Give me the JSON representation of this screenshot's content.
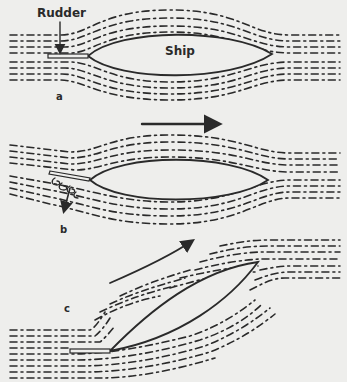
{
  "figure": {
    "labels": {
      "rudder": "Rudder",
      "ship": "Ship",
      "panel_a": "a",
      "panel_b": "b",
      "panel_c": "c"
    },
    "colors": {
      "background": "#eeeeec",
      "ink": "#2a2a2a"
    },
    "panels": [
      {
        "id": "a",
        "description": "Ship moving straight, rudder centered, streamlines symmetric around hull"
      },
      {
        "id": "b",
        "description": "Rudder angled, eddies form behind it, side force arrow pointing down"
      },
      {
        "id": "c",
        "description": "Ship turned diagonally, streamlines deflected, curved arrow showing turning direction"
      }
    ],
    "direction_arrow": {
      "description": "Flow / motion direction arrow pointing right"
    }
  }
}
